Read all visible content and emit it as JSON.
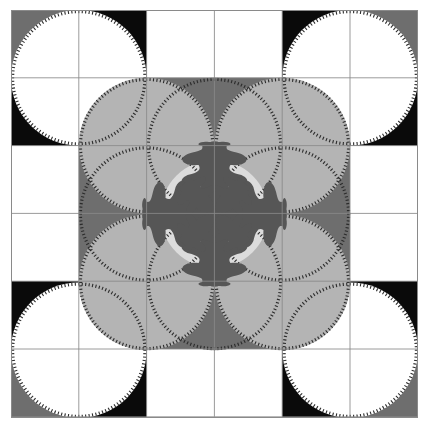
{
  "artwork": {
    "title": "Grayscale Geometric Quilt Pattern",
    "width": 429,
    "height": 428,
    "background": "#ffffff",
    "frame": {
      "x": 11,
      "y": 10,
      "width": 407,
      "height": 408,
      "stroke": "#8a8a8a",
      "stroke_width": 1
    },
    "palette": {
      "white": "#ffffff",
      "very_light_gray": "#dcdcdc",
      "light_gray": "#b4b4b4",
      "mid_gray": "#6e6e6e",
      "dark_gray": "#565656",
      "black": "#0a0a0a",
      "gridline": "#8a8a8a",
      "serration": "#2b2b2b"
    },
    "grid": {
      "columns": 6,
      "rows": 6,
      "cell_size": 67.8,
      "origin_x": 11,
      "origin_y": 10,
      "line_color": "#8a8a8a"
    },
    "block_colors": [
      [
        "mid_gray",
        "black",
        "white",
        "white",
        "black",
        "mid_gray"
      ],
      [
        "black",
        "white",
        "mid_gray",
        "mid_gray",
        "white",
        "black"
      ],
      [
        "white",
        "mid_gray",
        "light_gray",
        "light_gray",
        "mid_gray",
        "white"
      ],
      [
        "white",
        "mid_gray",
        "light_gray",
        "light_gray",
        "mid_gray",
        "white"
      ],
      [
        "black",
        "white",
        "mid_gray",
        "mid_gray",
        "white",
        "black"
      ],
      [
        "mid_gray",
        "black",
        "white",
        "white",
        "black",
        "mid_gray"
      ]
    ],
    "circles": [
      {
        "name": "corner-circle-top-left",
        "cx": 78.8,
        "cy": 77.8,
        "r": 67.8,
        "fill": "white"
      },
      {
        "name": "corner-circle-top-right",
        "cx": 350.2,
        "cy": 77.8,
        "r": 67.8,
        "fill": "white"
      },
      {
        "name": "corner-circle-bottom-left",
        "cx": 78.8,
        "cy": 350.2,
        "r": 67.8,
        "fill": "white"
      },
      {
        "name": "corner-circle-bottom-right",
        "cx": 350.2,
        "cy": 350.2,
        "r": 67.8,
        "fill": "white"
      },
      {
        "name": "petal-circle-top",
        "cx": 214.5,
        "cy": 145.6,
        "r": 67.8,
        "fill": "mid_gray"
      },
      {
        "name": "petal-circle-bottom",
        "cx": 214.5,
        "cy": 282.4,
        "r": 67.8,
        "fill": "mid_gray"
      },
      {
        "name": "petal-circle-left",
        "cx": 146.6,
        "cy": 214.0,
        "r": 67.8,
        "fill": "mid_gray"
      },
      {
        "name": "petal-circle-right",
        "cx": 282.4,
        "cy": 214.0,
        "r": 67.8,
        "fill": "mid_gray"
      },
      {
        "name": "inner-circle-top-left",
        "cx": 146.6,
        "cy": 145.6,
        "r": 67.8,
        "fill": "light_gray"
      },
      {
        "name": "inner-circle-top-right",
        "cx": 282.4,
        "cy": 145.6,
        "r": 67.8,
        "fill": "light_gray"
      },
      {
        "name": "inner-circle-bottom-left",
        "cx": 146.6,
        "cy": 282.4,
        "r": 67.8,
        "fill": "light_gray"
      },
      {
        "name": "inner-circle-bottom-right",
        "cx": 282.4,
        "cy": 282.4,
        "r": 67.8,
        "fill": "light_gray"
      },
      {
        "name": "center-medallion-circle",
        "cx": 214.5,
        "cy": 214.0,
        "r": 54.0,
        "fill": "very_light_gray"
      }
    ],
    "center_motif": {
      "name": "four-fold-oak-leaf-medallion",
      "fill": "#565656",
      "cx": 214.5,
      "cy": 214.0,
      "arms": 4,
      "arm_length": 72,
      "description": "Radially symmetric acanthus / oak-leaf rosette with four primary arms on the cardinal axes, each arm tipped with a trefoil, plus four secondary diagonal leaves."
    },
    "serration": {
      "enabled": true,
      "tick_count_per_circle": 120,
      "tick_length": 3.2,
      "color": "#2b2b2b",
      "description": "Fine radial tick marks along each circle edge resembling a saw-tooth or gear rim."
    }
  }
}
